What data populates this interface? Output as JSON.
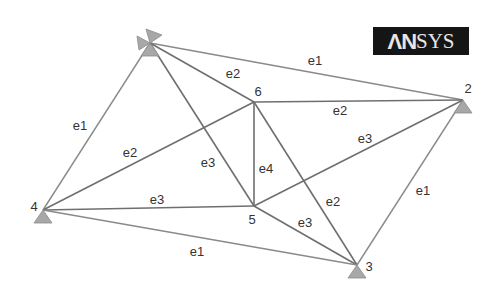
{
  "logo": {
    "bold_part": "ΛN",
    "thin_part": "SYS",
    "background": "#151515",
    "text_color": "#e6e6e6"
  },
  "colors": {
    "edge": "#6f6f6f",
    "support": "#a8a8a8",
    "label": "#333333"
  },
  "nodes": [
    {
      "id": "1",
      "x": 150,
      "y": 43,
      "label": "",
      "label_x": 0,
      "label_y": 0,
      "supports": [
        "left",
        "up-right",
        "down"
      ]
    },
    {
      "id": "2",
      "x": 463,
      "y": 100,
      "label": "2",
      "label_x": 468,
      "label_y": 88,
      "supports": [
        "down"
      ]
    },
    {
      "id": "3",
      "x": 357,
      "y": 265,
      "label": "3",
      "label_x": 369,
      "label_y": 266,
      "supports": [
        "down"
      ]
    },
    {
      "id": "4",
      "x": 43,
      "y": 210,
      "label": "4",
      "label_x": 34,
      "label_y": 206,
      "supports": [
        "down"
      ]
    },
    {
      "id": "5",
      "x": 254,
      "y": 206,
      "label": "5",
      "label_x": 252,
      "label_y": 219,
      "supports": []
    },
    {
      "id": "6",
      "x": 254,
      "y": 102,
      "label": "6",
      "label_x": 258,
      "label_y": 91,
      "supports": []
    }
  ],
  "edges": [
    {
      "from": "1",
      "to": "2",
      "label": "e1",
      "label_x": 315,
      "label_y": 60,
      "style": "light"
    },
    {
      "from": "1",
      "to": "4",
      "label": "e1",
      "label_x": 80,
      "label_y": 125,
      "style": "light"
    },
    {
      "from": "1",
      "to": "6",
      "label": "e2",
      "label_x": 233,
      "label_y": 73,
      "style": "dark"
    },
    {
      "from": "1",
      "to": "5",
      "label": "e3",
      "label_x": 208,
      "label_y": 162,
      "style": "dark"
    },
    {
      "from": "6",
      "to": "2",
      "label": "e2",
      "label_x": 340,
      "label_y": 110,
      "style": "dark"
    },
    {
      "from": "6",
      "to": "4",
      "label": "e2",
      "label_x": 130,
      "label_y": 152,
      "style": "dark"
    },
    {
      "from": "6",
      "to": "5",
      "label": "e4",
      "label_x": 266,
      "label_y": 168,
      "style": "dark"
    },
    {
      "from": "6",
      "to": "3",
      "label": "e2",
      "label_x": 333,
      "label_y": 201,
      "style": "dark"
    },
    {
      "from": "5",
      "to": "2",
      "label": "e3",
      "label_x": 365,
      "label_y": 138,
      "style": "dark"
    },
    {
      "from": "5",
      "to": "4",
      "label": "e3",
      "label_x": 157,
      "label_y": 199,
      "style": "dark"
    },
    {
      "from": "5",
      "to": "3",
      "label": "e3",
      "label_x": 305,
      "label_y": 222,
      "style": "dark"
    },
    {
      "from": "4",
      "to": "3",
      "label": "e1",
      "label_x": 197,
      "label_y": 251,
      "style": "light"
    },
    {
      "from": "2",
      "to": "3",
      "label": "e1",
      "label_x": 423,
      "label_y": 190,
      "style": "light"
    }
  ]
}
